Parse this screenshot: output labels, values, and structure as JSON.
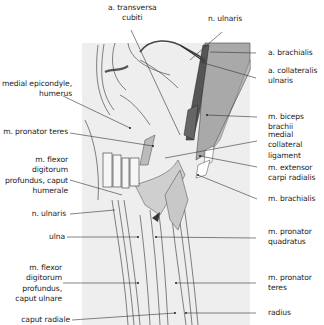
{
  "figure": {
    "type": "anatomical illustration",
    "colors": {
      "background": "#ffffff",
      "panel": "#eeeeee",
      "muscle_dark": "#5a5a5a",
      "muscle_mid": "#a9a9a9",
      "muscle_light": "#cfcfcf",
      "line": "#333333"
    }
  },
  "labels": {
    "top": [
      {
        "id": "a-transversa-cubiti",
        "text": "a. transversa\ncubiti"
      },
      {
        "id": "n-ulnaris-top",
        "text": "n. ulnaris"
      }
    ],
    "left": [
      {
        "id": "medial-epicondyle",
        "text": "medial epicondyle,\nhumerus"
      },
      {
        "id": "m-pronator-teres-left",
        "text": "m. pronator teres"
      },
      {
        "id": "m-fdp-caput-humerale",
        "text": "m. flexor\ndigitorum\nprofundus, caput\nhumerale"
      },
      {
        "id": "n-ulnaris-left",
        "text": "n. ulnaris"
      },
      {
        "id": "ulna",
        "text": "ulna"
      },
      {
        "id": "m-fdp-caput-ulnare",
        "text": "m. flexor\ndigitorum\nprofundus,\ncaput ulnare"
      },
      {
        "id": "caput-radiale",
        "text": "caput radiale"
      }
    ],
    "right": [
      {
        "id": "a-brachialis",
        "text": "a. brachialis"
      },
      {
        "id": "a-collateralis-ulnaris",
        "text": "a. collateralis\nulnaris"
      },
      {
        "id": "m-biceps-brachii",
        "text": "m. biceps brachii"
      },
      {
        "id": "medial-collateral-ligament",
        "text": "medial collateral\nligament"
      },
      {
        "id": "m-extensor-carpi-radialis",
        "text": "m. extensor\ncarpi radialis"
      },
      {
        "id": "m-brachialis",
        "text": "m. brachialis"
      },
      {
        "id": "m-pronator-quadratus",
        "text": "m. pronator\nquadratus"
      },
      {
        "id": "m-pronator-teres-right",
        "text": "m. pronator\nteres"
      },
      {
        "id": "radius",
        "text": "radius"
      }
    ]
  }
}
